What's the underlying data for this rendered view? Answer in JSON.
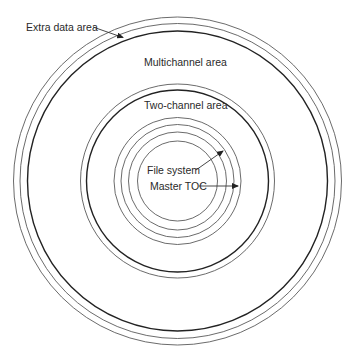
{
  "diagram": {
    "type": "concentric-disc-layout",
    "center": {
      "x": 177.5,
      "y": 181
    },
    "rings": [
      {
        "id": "outer-1",
        "r": 164,
        "stroke": "#5a5a5a",
        "width": 0.9
      },
      {
        "id": "outer-2",
        "r": 157.5,
        "stroke": "#5a5a5a",
        "width": 0.9
      },
      {
        "id": "outer-3",
        "r": 150,
        "stroke": "#222222",
        "width": 1.4
      },
      {
        "id": "middle-1",
        "r": 97,
        "stroke": "#5a5a5a",
        "width": 0.9
      },
      {
        "id": "middle-2",
        "r": 91,
        "stroke": "#222222",
        "width": 1.4
      },
      {
        "id": "inner-1",
        "r": 63.5,
        "stroke": "#5a5a5a",
        "width": 0.9
      },
      {
        "id": "inner-2",
        "r": 56.5,
        "stroke": "#5a5a5a",
        "width": 0.9
      },
      {
        "id": "inner-3",
        "r": 49,
        "stroke": "#5a5a5a",
        "width": 0.9
      },
      {
        "id": "inner-4",
        "r": 40,
        "stroke": "#5a5a5a",
        "width": 0.9
      }
    ],
    "labels": {
      "extra_data_area": "Extra data area",
      "multichannel_area": "Multichannel area",
      "two_channel_area": "Two-channel area",
      "file_system": "File system",
      "master_toc": "Master TOC"
    },
    "arrows": [
      {
        "id": "extra-data-arrow",
        "from": [
          93,
          27
        ],
        "to": [
          123,
          37.5
        ]
      },
      {
        "id": "file-system-arrow",
        "from": [
          196,
          170
        ],
        "to": [
          223,
          151
        ]
      },
      {
        "id": "master-toc-arrow",
        "from": [
          199,
          186
        ],
        "to": [
          238,
          186
        ]
      }
    ],
    "colors": {
      "background": "#ffffff",
      "text": "#2a2a2a",
      "line": "#333333"
    }
  }
}
